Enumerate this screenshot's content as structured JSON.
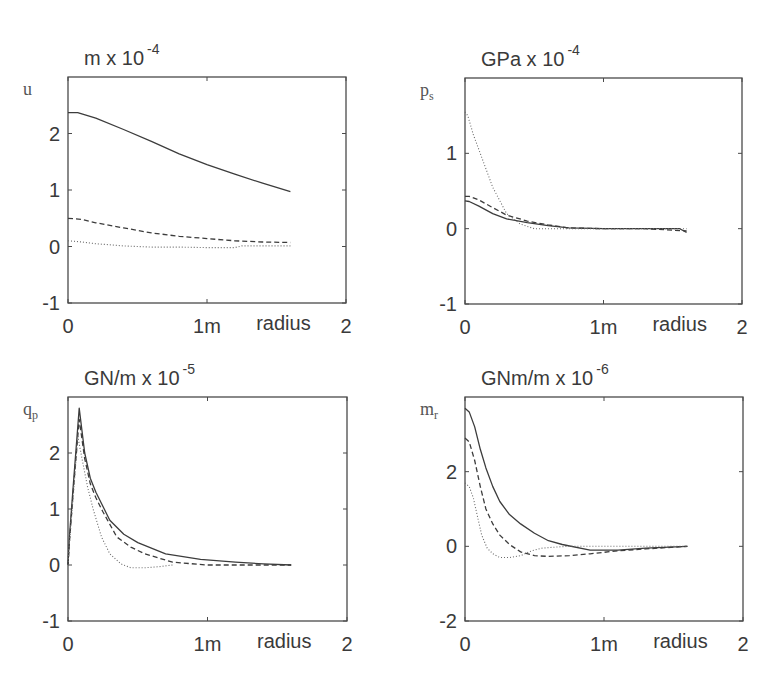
{
  "chart_data": [
    {
      "type": "line",
      "title": "m x 10",
      "title_exponent": "-4",
      "ylabel": "u",
      "ylabel_subscript": "",
      "xlabel": "radius",
      "xlim": [
        0,
        2
      ],
      "ylim": [
        -1,
        3
      ],
      "xticks": [
        {
          "value": 0,
          "label": "0"
        },
        {
          "value": 1,
          "label": "1m"
        },
        {
          "value": 2,
          "label": "2"
        }
      ],
      "yticks": [
        {
          "value": -1,
          "label": "-1"
        },
        {
          "value": 0,
          "label": "0"
        },
        {
          "value": 1,
          "label": "1"
        },
        {
          "value": 2,
          "label": "2"
        }
      ],
      "grid": false,
      "legend": null,
      "series": [
        {
          "name": "solid",
          "style": "solid",
          "x": [
            0,
            0.07,
            0.2,
            0.4,
            0.6,
            0.8,
            1.0,
            1.2,
            1.4,
            1.6
          ],
          "y": [
            2.37,
            2.37,
            2.27,
            2.07,
            1.86,
            1.64,
            1.45,
            1.28,
            1.12,
            0.97
          ]
        },
        {
          "name": "dashed",
          "style": "dashed",
          "x": [
            0,
            0.1,
            0.2,
            0.4,
            0.6,
            0.8,
            1.0,
            1.2,
            1.4,
            1.6
          ],
          "y": [
            0.5,
            0.48,
            0.42,
            0.33,
            0.24,
            0.18,
            0.14,
            0.1,
            0.08,
            0.07
          ]
        },
        {
          "name": "dotted",
          "style": "dotted",
          "x": [
            0,
            0.1,
            0.2,
            0.4,
            0.6,
            0.8,
            1.0,
            1.2,
            1.25,
            1.6
          ],
          "y": [
            0.1,
            0.08,
            0.05,
            0.01,
            -0.01,
            -0.01,
            -0.02,
            -0.02,
            0.01,
            0.01
          ]
        }
      ]
    },
    {
      "type": "line",
      "title": "GPa x 10",
      "title_exponent": "-4",
      "ylabel": "p",
      "ylabel_subscript": "s",
      "xlabel": "radius",
      "xlim": [
        0,
        2
      ],
      "ylim": [
        -1,
        2
      ],
      "xticks": [
        {
          "value": 0,
          "label": "0"
        },
        {
          "value": 1,
          "label": "1m"
        },
        {
          "value": 2,
          "label": "2"
        }
      ],
      "yticks": [
        {
          "value": -1,
          "label": "-1"
        },
        {
          "value": 0,
          "label": "0"
        },
        {
          "value": 1,
          "label": "1"
        }
      ],
      "grid": false,
      "legend": null,
      "series": [
        {
          "name": "solid",
          "style": "solid",
          "x": [
            0,
            0.03,
            0.1,
            0.2,
            0.3,
            0.45,
            0.6,
            0.75,
            1.0,
            1.3,
            1.55,
            1.6
          ],
          "y": [
            0.37,
            0.36,
            0.3,
            0.2,
            0.13,
            0.08,
            0.04,
            0.01,
            0.0,
            0.0,
            0.0,
            -0.05
          ]
        },
        {
          "name": "dashed",
          "style": "dashed",
          "x": [
            0,
            0.03,
            0.1,
            0.2,
            0.3,
            0.45,
            0.6,
            0.75,
            1.0,
            1.3,
            1.6
          ],
          "y": [
            0.43,
            0.43,
            0.38,
            0.28,
            0.18,
            0.1,
            0.05,
            0.01,
            0.0,
            0.0,
            -0.03
          ]
        },
        {
          "name": "dotted",
          "style": "dotted",
          "x": [
            0,
            0.02,
            0.06,
            0.12,
            0.2,
            0.3,
            0.4,
            0.5,
            0.7,
            1.0,
            1.6
          ],
          "y": [
            1.55,
            1.5,
            1.25,
            0.95,
            0.55,
            0.2,
            0.06,
            0.0,
            0.0,
            0.0,
            0.0
          ]
        }
      ]
    },
    {
      "type": "line",
      "title": "GN/m x 10",
      "title_exponent": "-5",
      "ylabel": "q",
      "ylabel_subscript": "p",
      "xlabel": "radius",
      "xlim": [
        0,
        2
      ],
      "ylim": [
        -1,
        3
      ],
      "xticks": [
        {
          "value": 0,
          "label": "0"
        },
        {
          "value": 1,
          "label": "1m"
        },
        {
          "value": 2,
          "label": "2"
        }
      ],
      "yticks": [
        {
          "value": -1,
          "label": "-1"
        },
        {
          "value": 0,
          "label": "0"
        },
        {
          "value": 1,
          "label": "1"
        },
        {
          "value": 2,
          "label": "2"
        }
      ],
      "grid": false,
      "legend": null,
      "series": [
        {
          "name": "solid",
          "style": "solid",
          "x": [
            0,
            0.01,
            0.04,
            0.08,
            0.12,
            0.16,
            0.2,
            0.3,
            0.4,
            0.5,
            0.7,
            0.95,
            1.2,
            1.4,
            1.6
          ],
          "y": [
            0,
            0.5,
            1.5,
            2.8,
            2.0,
            1.55,
            1.3,
            0.8,
            0.55,
            0.4,
            0.2,
            0.1,
            0.05,
            0.02,
            0.0
          ]
        },
        {
          "name": "dashed",
          "style": "dashed",
          "x": [
            0,
            0.01,
            0.04,
            0.08,
            0.12,
            0.16,
            0.2,
            0.25,
            0.35,
            0.45,
            0.55,
            0.75,
            1.0,
            1.6
          ],
          "y": [
            0,
            0.4,
            1.4,
            2.6,
            1.9,
            1.45,
            1.2,
            0.95,
            0.5,
            0.32,
            0.2,
            0.05,
            0.0,
            0.0
          ]
        },
        {
          "name": "dotted",
          "style": "dotted",
          "x": [
            0,
            0.01,
            0.04,
            0.07,
            0.1,
            0.14,
            0.18,
            0.24,
            0.3,
            0.38,
            0.45,
            0.55,
            0.65,
            0.75
          ],
          "y": [
            0,
            0.4,
            1.3,
            2.3,
            1.9,
            1.4,
            1.0,
            0.5,
            0.2,
            0.02,
            -0.05,
            -0.05,
            -0.03,
            0.0
          ]
        }
      ]
    },
    {
      "type": "line",
      "title": "GNm/m x 10",
      "title_exponent": "-6",
      "ylabel": "m",
      "ylabel_subscript": "r",
      "xlabel": "radius",
      "xlim": [
        0,
        2
      ],
      "ylim": [
        -2,
        4
      ],
      "xticks": [
        {
          "value": 0,
          "label": "0"
        },
        {
          "value": 1,
          "label": "1m"
        },
        {
          "value": 2,
          "label": "2"
        }
      ],
      "yticks": [
        {
          "value": -2,
          "label": "-2"
        },
        {
          "value": 0,
          "label": "0"
        },
        {
          "value": 2,
          "label": "2"
        }
      ],
      "grid": false,
      "legend": null,
      "series": [
        {
          "name": "solid",
          "style": "solid",
          "x": [
            0,
            0.03,
            0.07,
            0.11,
            0.15,
            0.2,
            0.25,
            0.32,
            0.4,
            0.5,
            0.6,
            0.7,
            0.9,
            1.1,
            1.3,
            1.6
          ],
          "y": [
            3.7,
            3.6,
            3.2,
            2.6,
            2.1,
            1.6,
            1.2,
            0.85,
            0.6,
            0.35,
            0.15,
            0.05,
            -0.1,
            -0.1,
            -0.05,
            0.0
          ]
        },
        {
          "name": "dashed",
          "style": "dashed",
          "x": [
            0,
            0.03,
            0.07,
            0.11,
            0.15,
            0.2,
            0.25,
            0.32,
            0.4,
            0.5,
            0.6,
            0.75,
            0.9,
            1.1,
            1.3,
            1.6
          ],
          "y": [
            2.9,
            2.8,
            2.3,
            1.6,
            1.0,
            0.6,
            0.3,
            0.05,
            -0.15,
            -0.25,
            -0.27,
            -0.25,
            -0.2,
            -0.12,
            -0.07,
            0.0
          ]
        },
        {
          "name": "dotted",
          "style": "dotted",
          "x": [
            0,
            0.03,
            0.06,
            0.09,
            0.12,
            0.16,
            0.2,
            0.25,
            0.32,
            0.4,
            0.48,
            0.55,
            0.65,
            0.75,
            1.0,
            1.6
          ],
          "y": [
            1.7,
            1.6,
            1.3,
            0.8,
            0.3,
            -0.05,
            -0.2,
            -0.3,
            -0.3,
            -0.25,
            -0.12,
            -0.05,
            -0.02,
            0.0,
            0.0,
            0.0
          ]
        }
      ]
    }
  ],
  "layout": {
    "panels": [
      {
        "left": 68,
        "top": 77,
        "width": 278,
        "height": 226
      },
      {
        "left": 465,
        "top": 78,
        "width": 277,
        "height": 226
      },
      {
        "left": 68,
        "top": 397,
        "width": 279,
        "height": 224
      },
      {
        "left": 465,
        "top": 397,
        "width": 278,
        "height": 224
      }
    ],
    "line_color": "#3c3c3c",
    "axis_color": "#4a4a4a"
  }
}
